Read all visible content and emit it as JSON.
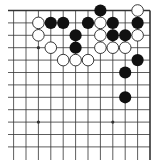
{
  "diagram": {
    "type": "go-board-partial",
    "view": "upper-right corner",
    "grid": {
      "origin_x": 150,
      "origin_y": 10.5,
      "spacing": 12.4,
      "columns_visible": 12,
      "rows_visible": 12,
      "line_left": 8,
      "line_bottom": 160,
      "edge_top": true,
      "edge_right": true
    },
    "colors": {
      "line": "#333333",
      "black_stone": "#111111",
      "white_stone_fill": "#ffffff",
      "white_stone_stroke": "#222222",
      "background": "#ffffff"
    },
    "star_points": [
      {
        "col": 10,
        "row": 4
      },
      {
        "col": 10,
        "row": 10
      },
      {
        "col": 4,
        "row": 10
      },
      {
        "col": 4,
        "row": 4
      }
    ],
    "stones": {
      "black": [
        {
          "col": 5,
          "row": 1
        },
        {
          "col": 9,
          "row": 2
        },
        {
          "col": 8,
          "row": 2
        },
        {
          "col": 6,
          "row": 2
        },
        {
          "col": 4,
          "row": 2
        },
        {
          "col": 2,
          "row": 2
        },
        {
          "col": 7,
          "row": 3
        },
        {
          "col": 4,
          "row": 3
        },
        {
          "col": 3,
          "row": 3
        },
        {
          "col": 7,
          "row": 4
        },
        {
          "col": 2,
          "row": 5
        },
        {
          "col": 3,
          "row": 6
        },
        {
          "col": 3,
          "row": 8
        }
      ],
      "white": [
        {
          "col": 2,
          "row": 1
        },
        {
          "col": 10,
          "row": 2
        },
        {
          "col": 5,
          "row": 2
        },
        {
          "col": 10,
          "row": 3
        },
        {
          "col": 5,
          "row": 3
        },
        {
          "col": 2,
          "row": 3
        },
        {
          "col": 9,
          "row": 4
        },
        {
          "col": 5,
          "row": 4
        },
        {
          "col": 4,
          "row": 4
        },
        {
          "col": 3,
          "row": 4
        },
        {
          "col": 8,
          "row": 5
        },
        {
          "col": 7,
          "row": 5
        },
        {
          "col": 6,
          "row": 5
        }
      ]
    }
  }
}
